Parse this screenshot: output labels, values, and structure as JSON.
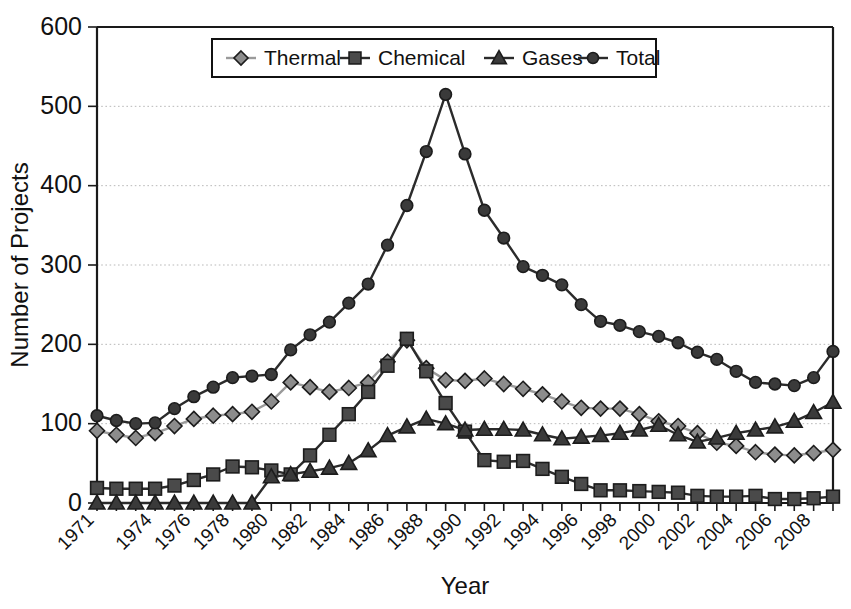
{
  "chart_data": {
    "type": "line",
    "title": "",
    "xlabel": "Year",
    "ylabel": "Number of Projects",
    "xlim": [
      1971,
      2009
    ],
    "ylim": [
      0,
      600
    ],
    "yticks": [
      0,
      100,
      200,
      300,
      400,
      500,
      600
    ],
    "xtick_labels": [
      "1971",
      "1974",
      "1976",
      "1978",
      "1980",
      "1982",
      "1984",
      "1986",
      "1988",
      "1990",
      "1992",
      "1994",
      "1996",
      "1998",
      "2000",
      "2002",
      "2004",
      "2006",
      "2008"
    ],
    "grid": "horizontal-dotted",
    "legend_position": "top-center",
    "x": [
      1971,
      1972,
      1973,
      1974,
      1975,
      1976,
      1977,
      1978,
      1979,
      1980,
      1981,
      1982,
      1983,
      1984,
      1985,
      1986,
      1987,
      1988,
      1989,
      1990,
      1991,
      1992,
      1993,
      1994,
      1995,
      1996,
      1997,
      1998,
      1999,
      2000,
      2001,
      2002,
      2003,
      2004,
      2005,
      2006,
      2007,
      2008,
      2009
    ],
    "series": [
      {
        "name": "Thermal",
        "marker": "diamond",
        "color": "#8c8c8c",
        "values": [
          91,
          86,
          82,
          88,
          97,
          106,
          110,
          112,
          115,
          128,
          152,
          146,
          140,
          145,
          152,
          178,
          205,
          170,
          155,
          154,
          157,
          150,
          144,
          137,
          128,
          120,
          119,
          119,
          112,
          103,
          97,
          88,
          76,
          72,
          64,
          61,
          60,
          63,
          67
        ]
      },
      {
        "name": "Chemical",
        "marker": "square",
        "color": "#4a4a4a",
        "values": [
          19,
          18,
          18,
          18,
          22,
          29,
          36,
          46,
          45,
          41,
          36,
          60,
          86,
          112,
          140,
          173,
          207,
          166,
          126,
          90,
          54,
          52,
          53,
          43,
          33,
          24,
          16,
          16,
          15,
          14,
          13,
          9,
          8,
          8,
          9,
          5,
          5,
          6,
          8
        ]
      },
      {
        "name": "Gases",
        "marker": "triangle",
        "color": "#3a3a3a",
        "values": [
          0,
          0,
          0,
          0,
          0,
          0,
          0,
          0,
          0,
          33,
          36,
          40,
          44,
          50,
          66,
          85,
          96,
          106,
          100,
          92,
          93,
          93,
          92,
          86,
          81,
          83,
          85,
          88,
          92,
          98,
          86,
          77,
          82,
          88,
          92,
          96,
          103,
          114,
          127
        ]
      },
      {
        "name": "Total",
        "marker": "circle",
        "color": "#3a3a3a",
        "values": [
          110,
          104,
          100,
          101,
          119,
          134,
          146,
          158,
          160,
          162,
          193,
          212,
          228,
          252,
          276,
          325,
          375,
          443,
          515,
          440,
          369,
          334,
          298,
          287,
          275,
          250,
          229,
          224,
          216,
          210,
          202,
          190,
          181,
          166,
          152,
          150,
          148,
          158,
          191
        ]
      }
    ]
  },
  "legend": {
    "items": [
      {
        "label": "Thermal"
      },
      {
        "label": "Chemical"
      },
      {
        "label": "Gases"
      },
      {
        "label": "Total"
      }
    ]
  }
}
